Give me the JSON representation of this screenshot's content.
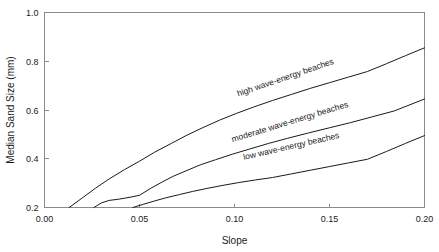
{
  "chart_data": {
    "type": "line",
    "title": "",
    "xlabel": "Slope",
    "ylabel": "Median Sand Size (mm)",
    "xlim": [
      0.0,
      0.2
    ],
    "ylim": [
      0.2,
      1.0
    ],
    "grid": false,
    "legend_position": "inline-curve-labels",
    "xticks": [
      0.0,
      0.05,
      0.1,
      0.15,
      0.2
    ],
    "xtick_labels": [
      "0.00",
      "0.05",
      "0.10",
      "0.15",
      "0.20"
    ],
    "yticks": [
      0.2,
      0.4,
      0.6,
      0.8,
      1.0
    ],
    "ytick_labels": [
      "0.2",
      "0.4",
      "0.6",
      "0.8",
      "1.0"
    ],
    "series": [
      {
        "name": "high wave-energy beaches",
        "label": "high wave-energy beaches",
        "label_angle_deg": -19,
        "label_x": 0.102,
        "label_y": 0.655,
        "x": [
          0.013,
          0.02,
          0.027,
          0.034,
          0.042,
          0.05,
          0.058,
          0.067,
          0.075,
          0.084,
          0.092,
          0.101,
          0.11,
          0.12,
          0.13,
          0.14,
          0.15,
          0.16,
          0.17,
          0.18,
          0.19,
          0.2
        ],
        "y": [
          0.2,
          0.24,
          0.28,
          0.317,
          0.355,
          0.39,
          0.427,
          0.464,
          0.497,
          0.53,
          0.558,
          0.586,
          0.612,
          0.639,
          0.664,
          0.689,
          0.712,
          0.735,
          0.758,
          0.79,
          0.823,
          0.855
        ]
      },
      {
        "name": "moderate wave-energy beaches",
        "label": "moderate wave-energy beaches",
        "label_angle_deg": -17,
        "label_x": 0.099,
        "label_y": 0.468,
        "x": [
          0.026,
          0.03,
          0.034,
          0.039,
          0.045,
          0.05,
          0.056,
          0.062,
          0.068,
          0.075,
          0.082,
          0.09,
          0.099,
          0.108,
          0.118,
          0.128,
          0.139,
          0.15,
          0.161,
          0.172,
          0.184,
          0.2
        ],
        "y": [
          0.2,
          0.219,
          0.229,
          0.234,
          0.242,
          0.25,
          0.279,
          0.305,
          0.329,
          0.352,
          0.375,
          0.396,
          0.419,
          0.44,
          0.463,
          0.484,
          0.506,
          0.527,
          0.548,
          0.571,
          0.596,
          0.645
        ]
      },
      {
        "name": "low wave-energy beaches",
        "label": "low wave-energy beaches",
        "label_angle_deg": -13,
        "label_x": 0.105,
        "label_y": 0.395,
        "x": [
          0.0465,
          0.052,
          0.058,
          0.064,
          0.071,
          0.078,
          0.086,
          0.094,
          0.102,
          0.111,
          0.12,
          0.13,
          0.14,
          0.15,
          0.16,
          0.17,
          0.18,
          0.19,
          0.2
        ],
        "y": [
          0.2,
          0.213,
          0.227,
          0.24,
          0.253,
          0.266,
          0.279,
          0.291,
          0.302,
          0.313,
          0.323,
          0.338,
          0.353,
          0.368,
          0.383,
          0.398,
          0.43,
          0.463,
          0.495
        ]
      }
    ]
  },
  "colors": {
    "background": "#ffffff",
    "frame": "#8a8a8a",
    "line": "#1a1a1a",
    "text": "#1a1a1a"
  }
}
